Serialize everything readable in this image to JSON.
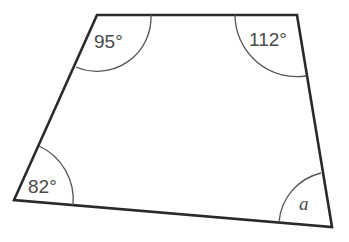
{
  "diagram": {
    "type": "quadrilateral",
    "vertices": {
      "top_left": [
        97,
        15
      ],
      "top_right": [
        297,
        15
      ],
      "bottom_right": [
        332,
        227
      ],
      "bottom_left": [
        14,
        200
      ]
    },
    "angles": [
      {
        "vertex": "top_left",
        "label": "95°"
      },
      {
        "vertex": "top_right",
        "label": "112°"
      },
      {
        "vertex": "bottom_left",
        "label": "82°"
      },
      {
        "vertex": "bottom_right",
        "label": "a"
      }
    ],
    "colors": {
      "stroke": "#2a2a2a",
      "arc": "#555555",
      "text": "#4a4a4a",
      "background": "#ffffff"
    }
  }
}
